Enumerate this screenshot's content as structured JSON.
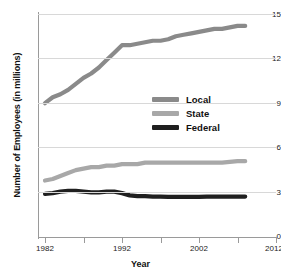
{
  "chart_data": {
    "type": "line",
    "title": "",
    "xlabel": "Year",
    "ylabel": "Number of Employees (in millions)",
    "xlim": [
      1982,
      2012
    ],
    "ylim": [
      0,
      15
    ],
    "grid": true,
    "legend_position": "center-right",
    "y_ticks": [
      15,
      12,
      9,
      6,
      3,
      0
    ],
    "y_tick_labels": [
      "15",
      "12",
      "9",
      "6",
      "3",
      "0"
    ],
    "x_ticks": [
      1982,
      1987,
      1992,
      1997,
      2002,
      2007,
      2012
    ],
    "x_tick_labels": [
      "1982",
      "",
      "1992",
      "",
      "2002",
      "",
      "2012"
    ],
    "x_major_labels": [
      "1982",
      "1992",
      "2002",
      "2012"
    ],
    "x": [
      1982,
      1983,
      1984,
      1985,
      1986,
      1987,
      1988,
      1989,
      1990,
      1991,
      1992,
      1993,
      1994,
      1995,
      1996,
      1997,
      1998,
      1999,
      2000,
      2001,
      2002,
      2003,
      2004,
      2005,
      2006,
      2007,
      2008
    ],
    "series": [
      {
        "name": "Local",
        "color": "#8a8a8a",
        "values": [
          9.0,
          9.4,
          9.6,
          9.9,
          10.3,
          10.7,
          11.0,
          11.4,
          11.9,
          12.4,
          12.9,
          12.9,
          13.0,
          13.1,
          13.2,
          13.2,
          13.3,
          13.5,
          13.6,
          13.7,
          13.8,
          13.9,
          14.0,
          14.0,
          14.1,
          14.2,
          14.2
        ]
      },
      {
        "name": "State",
        "color": "#a8a8a8",
        "values": [
          3.8,
          3.9,
          4.1,
          4.3,
          4.5,
          4.6,
          4.7,
          4.7,
          4.8,
          4.8,
          4.9,
          4.9,
          4.9,
          5.0,
          5.0,
          5.0,
          5.0,
          5.0,
          5.0,
          5.0,
          5.0,
          5.0,
          5.0,
          5.0,
          5.05,
          5.1,
          5.1
        ]
      },
      {
        "name": "Federal",
        "color": "#1f1f1f",
        "values": [
          2.9,
          2.95,
          3.05,
          3.1,
          3.1,
          3.05,
          3.0,
          3.0,
          3.05,
          3.05,
          2.95,
          2.8,
          2.75,
          2.75,
          2.72,
          2.72,
          2.7,
          2.7,
          2.7,
          2.7,
          2.7,
          2.72,
          2.72,
          2.72,
          2.72,
          2.72,
          2.72
        ]
      }
    ],
    "legend_entries": [
      {
        "label": "Local",
        "color": "#8a8a8a"
      },
      {
        "label": "State",
        "color": "#a8a8a8"
      },
      {
        "label": "Federal",
        "color": "#1f1f1f"
      }
    ]
  },
  "axis": {
    "y_title": "Number of Employees (in millions)",
    "x_title": "Year",
    "y_label_0": "15",
    "y_label_1": "12",
    "y_label_2": "9",
    "y_label_3": "6",
    "y_label_4": "3",
    "y_label_5": "0",
    "x_label_0": "1982",
    "x_label_1": "1992",
    "x_label_2": "2002",
    "x_label_3": "2012"
  },
  "legend": {
    "item_0": "Local",
    "item_1": "State",
    "item_2": "Federal"
  },
  "colors": {
    "local": "#8a8a8a",
    "state": "#a8a8a8",
    "federal": "#1f1f1f",
    "grid": "#d8d8d8",
    "axis": "#9a9a9a",
    "background": "#ffffff"
  }
}
